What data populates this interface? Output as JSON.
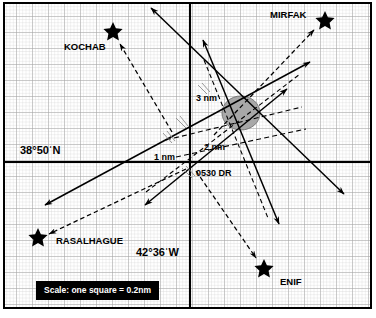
{
  "figure": {
    "type": "navigation-plot",
    "title_visible": false
  },
  "grid": {
    "minor_square_px": 3.2,
    "major_every": 5,
    "minor_color": "#c8c8c8",
    "major_color": "#9a9a9a",
    "border_color": "#000000"
  },
  "axes": {
    "origin_px": {
      "x": 190,
      "y": 162
    },
    "latitude_label": "38°50ˈN",
    "longitude_label": "42°36ˈW",
    "latitude_label_pos": {
      "x": 20,
      "y": 150
    },
    "longitude_label_pos": {
      "x": 136,
      "y": 252
    },
    "axis_color": "#000000"
  },
  "dr_position": {
    "label": "0530 DR",
    "label_pos": {
      "x": 196,
      "y": 166
    },
    "point_px": {
      "x": 190,
      "y": 162
    }
  },
  "cocked_hat": {
    "shape": "ellipse",
    "fill": "#a8a8a8",
    "stroke": "#6f6f6f",
    "center_px": {
      "x": 241,
      "y": 113
    },
    "rx": 19,
    "ry": 17
  },
  "range_labels": [
    {
      "text": "3 nm",
      "x": 196,
      "y": 99
    },
    {
      "text": "2 nm",
      "x": 204,
      "y": 148
    },
    {
      "text": "1 nm",
      "x": 156,
      "y": 158
    }
  ],
  "stars": [
    {
      "name": "MIRFAK",
      "label_pos": {
        "x": 270,
        "y": 14
      },
      "marker_px": {
        "x": 325,
        "y": 20
      },
      "marker_size": 9,
      "bearing_arrow": {
        "from": {
          "x": 272,
          "y": 75
        },
        "to": {
          "x": 315,
          "y": 31
        },
        "style": "dashed"
      }
    },
    {
      "name": "KOCHAB",
      "label_pos": {
        "x": 64,
        "y": 46
      },
      "marker_px": {
        "x": 113,
        "y": 31
      },
      "marker_size": 9,
      "bearing_arrow": {
        "from": {
          "x": 170,
          "y": 130
        },
        "to": {
          "x": 120,
          "y": 43
        },
        "style": "dashed"
      }
    },
    {
      "name": "RASALHAGUE",
      "label_pos": {
        "x": 56,
        "y": 240
      },
      "marker_px": {
        "x": 38,
        "y": 237
      },
      "marker_size": 9,
      "bearing_arrow": {
        "from": {
          "x": 185,
          "y": 170
        },
        "to": {
          "x": 48,
          "y": 234
        },
        "style": "dashed"
      }
    },
    {
      "name": "ENIF",
      "label_pos": {
        "x": 280,
        "y": 281
      },
      "marker_px": {
        "x": 264,
        "y": 268
      },
      "marker_size": 9,
      "bearing_arrow": {
        "from": {
          "x": 196,
          "y": 172
        },
        "to": {
          "x": 257,
          "y": 259
        },
        "style": "dashed"
      }
    }
  ],
  "position_lines": [
    {
      "name": "pl-mirfak-solid",
      "x1": 45,
      "y1": 205,
      "x2": 310,
      "y2": 62,
      "arrows": "both",
      "style": "solid"
    },
    {
      "name": "pl-kochab-solid",
      "x1": 150,
      "y1": 7,
      "x2": 345,
      "y2": 195,
      "arrows": "both",
      "style": "solid"
    },
    {
      "name": "pl-enif-solid",
      "x1": 202,
      "y1": 38,
      "x2": 280,
      "y2": 226,
      "arrows": "both",
      "style": "solid"
    },
    {
      "name": "pl-rasalhague-solid",
      "x1": 288,
      "y1": 88,
      "x2": 144,
      "y2": 206,
      "arrows": "both",
      "style": "solid"
    }
  ],
  "transferred_lines": [
    {
      "name": "tpl-a",
      "x1": 168,
      "y1": 138,
      "x2": 300,
      "y2": 108,
      "style": "dashed"
    },
    {
      "name": "tpl-b",
      "x1": 176,
      "y1": 156,
      "x2": 305,
      "y2": 128,
      "style": "dashed"
    }
  ],
  "scale": {
    "text": "Scale: one square = 0.2nm",
    "background": "#000000",
    "foreground": "#ffffff"
  }
}
